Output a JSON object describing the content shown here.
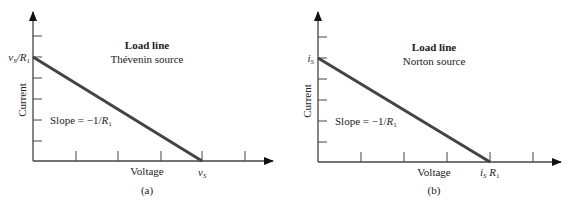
{
  "panels": [
    {
      "id": "a",
      "caption": "(a)",
      "title": "Load line",
      "subtitle": "Thévenin source",
      "y_axis_label": "Current",
      "x_axis_label": "Voltage",
      "y_intercept_label": {
        "main": "v",
        "sub1": "S",
        "rest": "/R",
        "sub2": "1"
      },
      "x_intercept_label": {
        "main": "v",
        "sub1": "S",
        "rest": "",
        "sub2": ""
      },
      "slope_label": {
        "prefix": "Slope = −1/",
        "var": "R",
        "sub": "1"
      },
      "line_color": "#444444"
    },
    {
      "id": "b",
      "caption": "(b)",
      "title": "Load line",
      "subtitle": "Norton source",
      "y_axis_label": "Current",
      "x_axis_label": "Voltage",
      "y_intercept_label": {
        "main": "i",
        "sub1": "S",
        "rest": "",
        "sub2": ""
      },
      "x_intercept_label": {
        "main": "i",
        "sub1": "S",
        "rest": " R",
        "sub2": "1"
      },
      "slope_label": {
        "prefix": "Slope = −1/",
        "var": "R",
        "sub": "1"
      },
      "line_color": "#444444"
    }
  ]
}
